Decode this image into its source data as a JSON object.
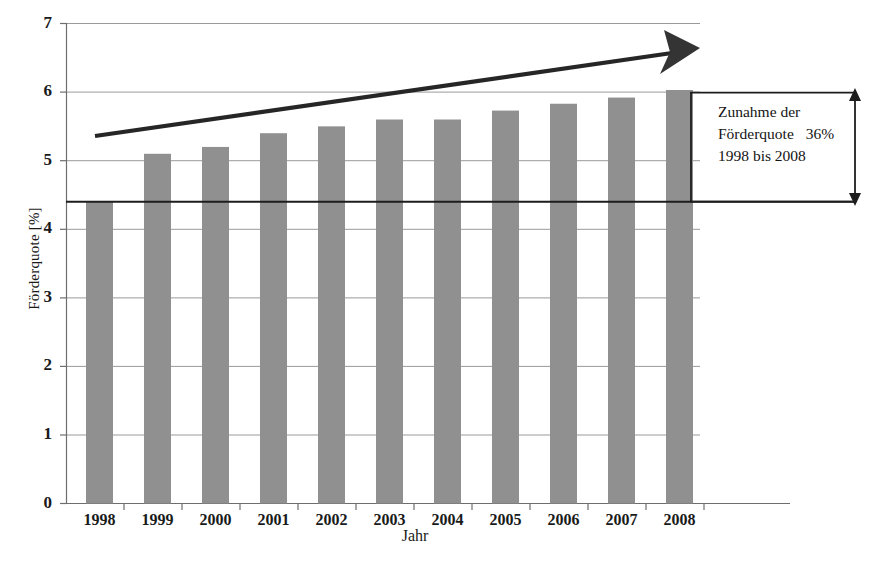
{
  "chart_data": {
    "type": "bar",
    "title": "",
    "xlabel": "Jahr",
    "ylabel": "Förderquote [%]",
    "categories": [
      "1998",
      "1999",
      "2000",
      "2001",
      "2002",
      "2003",
      "2004",
      "2005",
      "2006",
      "2007",
      "2008"
    ],
    "values": [
      4.4,
      5.1,
      5.2,
      5.4,
      5.5,
      5.6,
      5.6,
      5.73,
      5.83,
      5.92,
      6.03
    ],
    "ylim": [
      0,
      7
    ],
    "yticks": [
      "0",
      "1",
      "2",
      "3",
      "4",
      "5",
      "6",
      "7"
    ],
    "grid": true,
    "legend": "none",
    "bar_color": "#909090",
    "reference_line": {
      "value": 4.4,
      "color": "#202020"
    },
    "trend_arrow": {
      "from_value": 5.35,
      "to_value": 6.7,
      "color": "#262626"
    },
    "annotation": {
      "line1": "Zunahme der",
      "line2": "Förderquote",
      "percent": "36%",
      "line3": "1998 bis 2008",
      "bracket_from": 4.4,
      "bracket_to": 6.03
    }
  }
}
